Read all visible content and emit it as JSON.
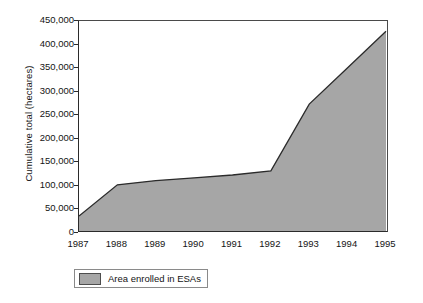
{
  "chart_data": {
    "type": "area",
    "title": "",
    "xlabel": "",
    "ylabel": "Cumulative total (hectares)",
    "categories": [
      "1987",
      "1988",
      "1989",
      "1990",
      "1991",
      "1992",
      "1993",
      "1994",
      "1995"
    ],
    "values": [
      32000,
      99000,
      108000,
      114000,
      120000,
      129000,
      272000,
      350000,
      428000
    ],
    "series": [
      {
        "name": "Area enrolled in ESAs",
        "values": [
          32000,
          99000,
          108000,
          114000,
          120000,
          129000,
          272000,
          350000,
          428000
        ]
      }
    ],
    "ylim": [
      0,
      450000
    ],
    "ytick_labels": [
      "0",
      "50,000",
      "100,000",
      "150,000",
      "200,000",
      "250,000",
      "300,000",
      "350,000",
      "400,000",
      "450,000"
    ],
    "ytick_values": [
      0,
      50000,
      100000,
      150000,
      200000,
      250000,
      300000,
      350000,
      400000,
      450000
    ],
    "xtick_labels": [
      "1987",
      "1988",
      "1989",
      "1990",
      "1991",
      "1992",
      "1993",
      "1994",
      "1995"
    ],
    "grid": false,
    "legend_position": "bottom-left",
    "legend": [
      {
        "label": "Area enrolled in ESAs",
        "fill_color": "#a6a6a6",
        "line_color": "#4d4d4d"
      }
    ],
    "colors": {
      "area_fill": "#a6a6a6",
      "area_line": "#2b2b2b",
      "axis": "#2b2b2b",
      "text": "#141414",
      "background": "#ffffff"
    }
  }
}
